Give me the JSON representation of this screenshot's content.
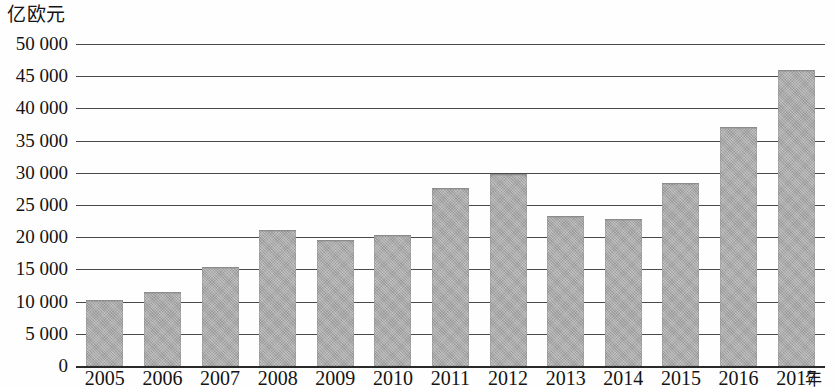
{
  "chart_data": {
    "type": "bar",
    "title": "",
    "subtitle": "",
    "ylabel": "亿欧元",
    "xlabel": "年",
    "categories": [
      "2005",
      "2006",
      "2007",
      "2008",
      "2009",
      "2010",
      "2011",
      "2012",
      "2013",
      "2014",
      "2015",
      "2016",
      "2017"
    ],
    "values": [
      10100,
      11400,
      15200,
      20900,
      19400,
      20200,
      27500,
      29700,
      23100,
      22600,
      28200,
      36900,
      45800
    ],
    "series": [
      {
        "name": "亿欧元",
        "values": [
          10100,
          11400,
          15200,
          20900,
          19400,
          20200,
          27500,
          29700,
          23100,
          22600,
          28200,
          36900,
          45800
        ]
      }
    ],
    "ylim": [
      0,
      50000
    ],
    "ytick_labels": [
      "50 000",
      "45 000",
      "40 000",
      "35 000",
      "30 000",
      "25 000",
      "20 000",
      "15 000",
      "10 000",
      "5 000",
      "0"
    ],
    "ytick_values": [
      50000,
      45000,
      40000,
      35000,
      30000,
      25000,
      20000,
      15000,
      10000,
      5000,
      0
    ],
    "grid": true,
    "grid_axis": "y",
    "legend": false,
    "legend_position": "none",
    "bar_color": "#a9a9a9",
    "axis_color": "#2a2a2a",
    "gridline_color": "#4a4a4a"
  }
}
